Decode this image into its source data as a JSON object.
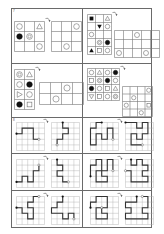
{
  "page": {
    "section_labels": [
      "7",
      "8"
    ]
  },
  "shape_puzzles": [
    {
      "id": "A",
      "source": {
        "cols": 3,
        "rows": 3,
        "cells": [
          [
            "circle",
            "",
            "triangle"
          ],
          [
            "filled-circle",
            "double-circle",
            ""
          ],
          [
            "",
            "",
            "circle"
          ]
        ]
      },
      "target": {
        "cols": 3,
        "rows": 3,
        "cells": [
          [
            "",
            "",
            "circle"
          ],
          [
            "",
            "",
            ""
          ],
          [
            "",
            "circle",
            ""
          ]
        ]
      }
    },
    {
      "id": "B",
      "source": {
        "cols": 3,
        "rows": 5,
        "cells": [
          [
            "filled-square",
            "",
            "triangle"
          ],
          [
            "",
            "filled-down-triangle",
            "circle"
          ],
          [
            "circle",
            "",
            ""
          ],
          [
            "",
            "double-circle",
            "filled-circle"
          ],
          [
            "filled-triangle",
            "square",
            "circle"
          ]
        ]
      },
      "target": {
        "cols": 5,
        "rows": 3,
        "cells": [
          [
            "",
            "",
            "circle",
            "",
            ""
          ],
          [
            "",
            "",
            "",
            "",
            ""
          ],
          [
            "circle",
            "",
            "",
            "circle",
            ""
          ]
        ]
      }
    },
    {
      "id": "C",
      "source": {
        "cols": 2,
        "rows": 4,
        "cells": [
          [
            "double-circle",
            "triangle"
          ],
          [
            "circle",
            "filled-circle"
          ],
          [
            "right-triangle",
            "circle"
          ],
          [
            "filled-circle",
            "square"
          ]
        ]
      },
      "target": {
        "cols": 4,
        "rows": 2,
        "cells": [
          [
            "",
            "",
            "circle",
            ""
          ],
          [
            "",
            "circle",
            "",
            ""
          ]
        ]
      }
    },
    {
      "id": "D",
      "source": {
        "cols": 4,
        "rows": 4,
        "cells": [
          [
            "circle",
            "triangle",
            "circle",
            "filled-circle"
          ],
          [
            "square",
            "double-circle",
            "filled-circle",
            "circle"
          ],
          [
            "filled-circle",
            "circle",
            "square",
            "triangle"
          ],
          [
            "down-triangle",
            "square",
            "circle",
            "double-circle"
          ]
        ]
      },
      "target": {
        "cols": 4,
        "rows": 4,
        "cells": [
          [
            "",
            "",
            "",
            "circle"
          ],
          [
            "",
            "circle",
            "",
            ""
          ],
          [
            "circle",
            "",
            "",
            "square"
          ],
          [
            "",
            "",
            "circle",
            ""
          ]
        ]
      }
    }
  ],
  "path_puzzles": [
    {
      "source": [
        [
          0,
          2
        ],
        [
          1,
          2
        ],
        [
          1,
          1
        ],
        [
          3,
          1
        ],
        [
          3,
          3
        ],
        [
          4,
          3
        ]
      ],
      "target": [
        [
          2,
          0
        ],
        [
          2,
          1
        ],
        [
          3,
          1
        ],
        [
          3,
          2
        ],
        [
          2,
          2
        ],
        [
          2,
          3
        ],
        [
          1,
          3
        ],
        [
          1,
          4
        ]
      ]
    },
    {
      "source": [
        [
          2,
          0
        ],
        [
          1,
          0
        ],
        [
          1,
          1
        ],
        [
          0,
          1
        ],
        [
          0,
          4
        ],
        [
          1,
          4
        ],
        [
          1,
          2
        ],
        [
          2,
          2
        ],
        [
          2,
          3
        ],
        [
          3,
          3
        ],
        [
          3,
          1
        ],
        [
          4,
          1
        ],
        [
          4,
          3
        ]
      ],
      "target": [
        [
          0,
          0
        ],
        [
          2,
          0
        ],
        [
          2,
          1
        ],
        [
          3,
          1
        ],
        [
          3,
          0
        ],
        [
          4,
          0
        ],
        [
          4,
          2
        ],
        [
          3,
          2
        ],
        [
          3,
          3
        ],
        [
          2,
          3
        ],
        [
          2,
          2
        ],
        [
          1,
          2
        ],
        [
          1,
          4
        ],
        [
          3,
          4
        ]
      ]
    },
    {
      "source": [
        [
          0,
          4
        ],
        [
          1,
          4
        ],
        [
          1,
          3
        ],
        [
          2,
          3
        ],
        [
          2,
          4
        ],
        [
          3,
          4
        ],
        [
          3,
          2
        ],
        [
          4,
          2
        ],
        [
          4,
          1
        ]
      ],
      "target": [
        [
          1,
          0
        ],
        [
          1,
          1
        ],
        [
          2,
          1
        ],
        [
          2,
          2
        ],
        [
          1,
          2
        ],
        [
          1,
          3
        ],
        [
          2,
          3
        ],
        [
          2,
          4
        ],
        [
          3,
          4
        ]
      ]
    },
    {
      "source": [
        [
          0,
          3
        ],
        [
          0,
          1
        ],
        [
          1,
          1
        ],
        [
          1,
          0
        ],
        [
          2,
          0
        ],
        [
          2,
          2
        ],
        [
          1,
          2
        ],
        [
          1,
          4
        ],
        [
          3,
          4
        ],
        [
          3,
          3
        ],
        [
          2,
          3
        ],
        [
          2,
          2
        ],
        [
          3,
          2
        ],
        [
          3,
          0
        ],
        [
          4,
          0
        ],
        [
          4,
          2
        ]
      ],
      "target": [
        [
          1,
          0
        ],
        [
          1,
          1
        ],
        [
          2,
          1
        ],
        [
          2,
          0
        ],
        [
          3,
          0
        ],
        [
          3,
          1
        ],
        [
          4,
          1
        ],
        [
          4,
          2
        ],
        [
          3,
          2
        ],
        [
          3,
          3
        ],
        [
          4,
          3
        ],
        [
          4,
          4
        ],
        [
          1,
          4
        ],
        [
          1,
          2
        ],
        [
          0,
          2
        ]
      ]
    },
    {
      "source": [
        [
          0,
          2
        ],
        [
          1,
          2
        ],
        [
          1,
          3
        ],
        [
          2,
          3
        ],
        [
          2,
          4
        ],
        [
          3,
          4
        ],
        [
          3,
          2
        ],
        [
          2,
          2
        ],
        [
          2,
          1
        ],
        [
          3,
          1
        ],
        [
          3,
          0
        ],
        [
          4,
          0
        ]
      ],
      "target": [
        [
          2,
          0
        ],
        [
          2,
          1
        ],
        [
          1,
          1
        ],
        [
          1,
          2
        ],
        [
          0,
          2
        ],
        [
          0,
          3
        ],
        [
          2,
          3
        ],
        [
          2,
          4
        ],
        [
          3,
          4
        ],
        [
          3,
          3
        ],
        [
          4,
          3
        ],
        [
          4,
          4
        ]
      ]
    },
    {
      "source": [
        [
          0,
          2
        ],
        [
          0,
          1
        ],
        [
          1,
          1
        ],
        [
          1,
          0
        ],
        [
          3,
          0
        ],
        [
          3,
          2
        ],
        [
          2,
          2
        ],
        [
          2,
          3
        ],
        [
          3,
          3
        ],
        [
          3,
          4
        ],
        [
          1,
          4
        ],
        [
          1,
          2
        ],
        [
          2,
          2
        ]
      ],
      "target": [
        [
          2,
          0
        ],
        [
          2,
          1
        ],
        [
          0,
          1
        ],
        [
          0,
          2
        ],
        [
          1,
          2
        ],
        [
          1,
          3
        ],
        [
          0,
          3
        ],
        [
          0,
          4
        ],
        [
          4,
          4
        ],
        [
          4,
          3
        ],
        [
          3,
          3
        ],
        [
          3,
          2
        ],
        [
          4,
          2
        ],
        [
          4,
          0
        ],
        [
          3,
          0
        ]
      ]
    }
  ]
}
